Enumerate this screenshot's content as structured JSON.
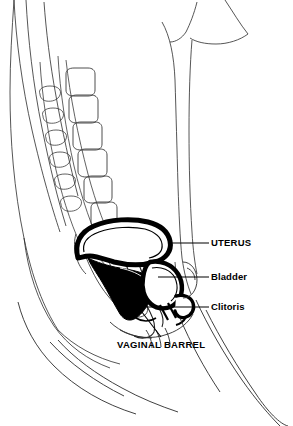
{
  "figure": {
    "kind": "medical-line-drawing",
    "width": 293,
    "height": 426,
    "background_color": "#ffffff",
    "line_color": "#000000",
    "thin_line_color": "#333333"
  },
  "labels": [
    {
      "id": "uterus",
      "text": "UTERUS",
      "case": "uppercase",
      "x": 211,
      "y": 238,
      "leader": {
        "x1": 168,
        "y1": 243,
        "x2": 209,
        "y2": 243
      }
    },
    {
      "id": "bladder",
      "text": "Bladder",
      "case": "mixed",
      "x": 211,
      "y": 272,
      "leader": {
        "x1": 158,
        "y1": 277,
        "x2": 209,
        "y2": 277
      }
    },
    {
      "id": "clitoris",
      "text": "Clitoris",
      "case": "mixed",
      "x": 211,
      "y": 302,
      "leader": {
        "x1": 146,
        "y1": 307,
        "x2": 209,
        "y2": 307
      }
    },
    {
      "id": "vaginal-barrel",
      "text": "VAGINAL BARREL",
      "case": "uppercase",
      "x": 117,
      "y": 340,
      "leader": {
        "x1": 135,
        "y1": 303,
        "x2": 161,
        "y2": 337
      }
    }
  ],
  "structures": [
    {
      "id": "lumbar-spine",
      "name": "Lumbar vertebrae",
      "description": "Column of rounded rectangular vertebral bodies with oval spinous processes, curving down the left side",
      "vertebral_body_count": 6,
      "spinous_process_count": 6
    },
    {
      "id": "sacrum",
      "name": "Sacrum",
      "description": "Tapering segmented bone below the lumbar spine"
    },
    {
      "id": "coccyx",
      "name": "Coccyx",
      "description": "Small curved tail bone at the base of the sacrum"
    },
    {
      "id": "back-contour",
      "name": "Posterior body wall",
      "description": "Thin outer contour lines of the back"
    },
    {
      "id": "abdominal-wall",
      "name": "Anterior abdominal wall",
      "description": "Near-vertical thin contour lines on the right"
    },
    {
      "id": "rectum",
      "name": "Rectum",
      "description": "Curved tube anterior to the sacrum"
    },
    {
      "id": "uterus-body",
      "name": "Uterus",
      "description": "Thick black outlined anteverted pear shape with white interior"
    },
    {
      "id": "cervix",
      "name": "Cervix",
      "description": "Narrowed junction between uterine body and vagina"
    },
    {
      "id": "vaginal-barrel-solid",
      "name": "Vaginal barrel",
      "description": "Solid black filled canal running inferiorly from the cervix"
    },
    {
      "id": "bladder-body",
      "name": "Bladder",
      "description": "Rounded thick-outlined sac anterior and inferior to the uterus"
    },
    {
      "id": "urethra",
      "name": "Urethra",
      "description": "Short channel from bladder neck to the vestibule"
    },
    {
      "id": "clitoris-body",
      "name": "Clitoris",
      "description": "Small hook-shaped structure at the anterior vulva"
    },
    {
      "id": "pubic-bone",
      "name": "Pubic symphysis",
      "description": "Oval bone anterior to the bladder"
    },
    {
      "id": "thigh-contour",
      "name": "Thigh contours",
      "description": "Long converging lines at the lower portion of the figure"
    }
  ]
}
